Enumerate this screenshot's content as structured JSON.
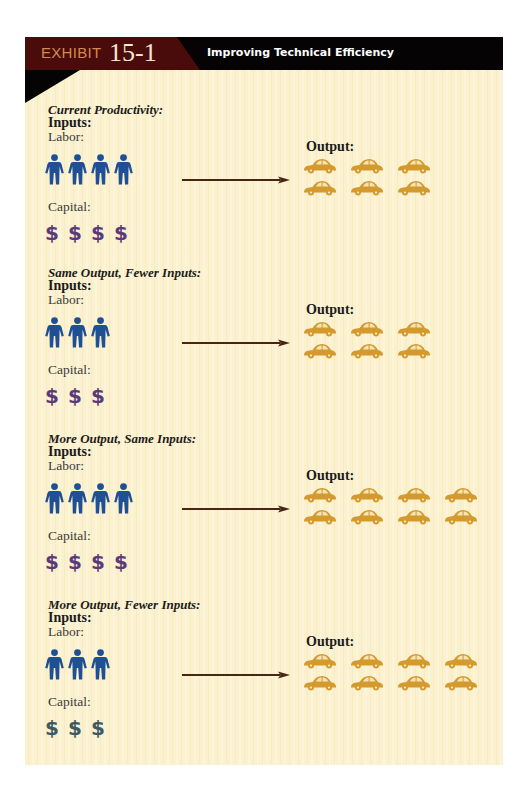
{
  "header": {
    "exhibit_label": "EXHIBIT",
    "exhibit_number": "15-1",
    "title": "Improving Technical Efficiency"
  },
  "colors": {
    "header_black": "#050303",
    "header_maroon": "#4a0b0b",
    "exhibit_label": "#d38a4a",
    "labor_icon": "#1f4f95",
    "capital_purple": "#5b3a7a",
    "capital_slate": "#3c5a63",
    "car": "#d49a2e",
    "arrow": "#4a2412",
    "page_background": "#fbf1cf"
  },
  "labels": {
    "inputs": "Inputs:",
    "labor": "Labor:",
    "capital": "Capital:",
    "output": "Output:"
  },
  "sections": [
    {
      "title": "Current Productivity:",
      "labor_count": 4,
      "capital_count": 4,
      "capital_color": "purple",
      "output_count": 6,
      "output_columns": 3
    },
    {
      "title": "Same Output, Fewer Inputs:",
      "labor_count": 3,
      "capital_count": 3,
      "capital_color": "purple",
      "output_count": 6,
      "output_columns": 3
    },
    {
      "title": "More Output, Same Inputs:",
      "labor_count": 4,
      "capital_count": 4,
      "capital_color": "purple",
      "output_count": 8,
      "output_columns": 4
    },
    {
      "title": "More Output, Fewer Inputs:",
      "labor_count": 3,
      "capital_count": 3,
      "capital_color": "slate",
      "output_count": 8,
      "output_columns": 4
    }
  ],
  "icons": {
    "labor": "person-icon",
    "capital": "dollar-sign-icon",
    "output": "car-icon",
    "transform": "arrow-right-icon",
    "dollar_glyph": "$"
  }
}
